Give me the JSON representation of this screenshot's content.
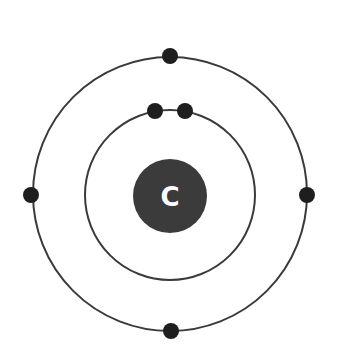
{
  "diagram": {
    "type": "bohr-model",
    "element_symbol": "C",
    "center": {
      "x": 170,
      "y": 195
    },
    "nucleus": {
      "radius": 37,
      "color": "#3b3b3b",
      "label_color": "#ffffff"
    },
    "shells": [
      {
        "name": "inner-shell",
        "radius": 85,
        "electrons": 2,
        "electron_positions_deg": [
          -100,
          -80
        ]
      },
      {
        "name": "outer-shell",
        "radius": 137,
        "electrons": 4,
        "electron_positions_deg": [
          -90,
          0,
          90,
          180
        ]
      }
    ],
    "electron": {
      "radius": 8,
      "color": "#1e1e1e"
    },
    "ring_color": "#3a3a3a"
  }
}
